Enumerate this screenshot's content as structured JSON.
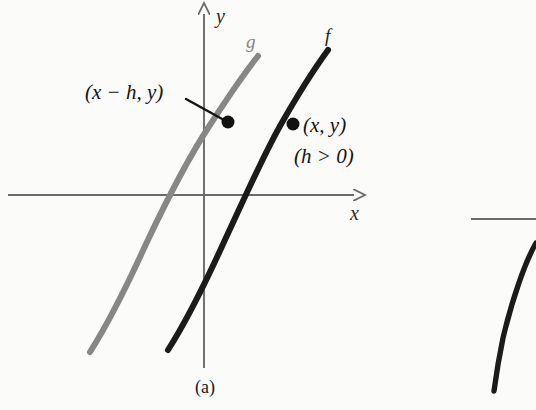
{
  "figure": {
    "caption": "(a)",
    "background_color": "#fbfbf9",
    "axes": {
      "x_axis_label": "x",
      "y_axis_label": "y",
      "axis_color": "#6b6b6b",
      "x_axis": {
        "x1": 8,
        "y1": 195,
        "x2": 360,
        "y2": 195,
        "arrow": "right"
      },
      "y_axis": {
        "x1": 204,
        "y1": 368,
        "x2": 204,
        "y2": 8,
        "arrow": "up"
      }
    },
    "curves": [
      {
        "name": "g",
        "color": "#878787",
        "width": 6,
        "label_x": 246,
        "label_y": 32,
        "path": "M 90,352 C 104,330 126,288 146,244 C 163,208 186,162 208,128 C 226,100 242,76 258,56"
      },
      {
        "name": "f",
        "color": "#1b1b1b",
        "width": 6,
        "label_x": 325,
        "label_y": 26,
        "path": "M 168,350 C 182,328 204,286 224,242 C 241,206 260,162 280,126 C 297,96 312,72 328,50"
      }
    ],
    "points": [
      {
        "id": "point-g",
        "label": "(x − h, y)",
        "label_x": 85,
        "label_y": 82,
        "cx": 228,
        "cy": 122,
        "r": 6.5,
        "color": "#121212",
        "leader": {
          "x1": 186,
          "y1": 99,
          "x2": 224,
          "y2": 120
        }
      },
      {
        "id": "point-f",
        "label": "(x, y)",
        "label_x": 303,
        "label_y": 115,
        "cx": 293,
        "cy": 124,
        "r": 6.5,
        "color": "#121212",
        "leader": null
      }
    ],
    "annotations": [
      {
        "id": "condition",
        "text": "(h > 0)",
        "x": 294,
        "y": 146
      }
    ]
  },
  "adjacent_figure": {
    "axis_color": "#6b6b6b",
    "curve_color": "#1b1b1b",
    "x_axis": {
      "x1": 471,
      "y1": 219,
      "x2": 536,
      "y2": 219
    },
    "curve_path": "M 536,243 C 525,262 512,300 503,338 C 499,357 496,376 494,391"
  }
}
